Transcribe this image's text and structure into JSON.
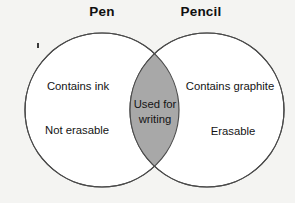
{
  "diagram": {
    "type": "venn",
    "title_left": "Pen",
    "title_right": "Pencil",
    "background_color": "#f4f4f2",
    "circle_fill": "#ffffff",
    "circle_stroke": "#4a4a4a",
    "overlap_fill": "#a8a8a8",
    "left_set": {
      "label": "Pen",
      "items": [
        "Contains ink",
        "Not erasable"
      ]
    },
    "right_set": {
      "label": "Pencil",
      "items": [
        "Contains graphite",
        "Erasable"
      ]
    },
    "intersection": {
      "text": "Used for\nwriting",
      "line_1": "Used for",
      "line_2": "writing"
    },
    "artifact": {
      "name": "scan-speck",
      "color": "#3a3a3a"
    }
  }
}
